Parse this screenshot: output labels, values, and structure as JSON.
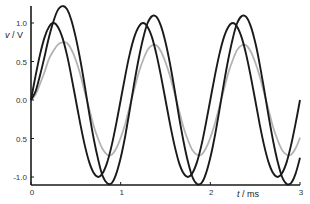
{
  "chart_data": {
    "type": "line",
    "title": "",
    "xlabel_var": "t",
    "xlabel_unit": " / ms",
    "ylabel_var": "v",
    "ylabel_unit": " / V",
    "xlim": [
      0,
      3
    ],
    "ylim": [
      -1.15,
      1.25
    ],
    "grid": false,
    "legend": "none",
    "x_ticks": [
      {
        "value": 0,
        "label": "0"
      },
      {
        "value": 1,
        "label": "1"
      },
      {
        "value": 2,
        "label": "2"
      },
      {
        "value": 3,
        "label": "3"
      }
    ],
    "y_ticks": [
      {
        "value": 1.0,
        "label": "1.0"
      },
      {
        "value": 0.5,
        "label": "0.5"
      },
      {
        "value": 0.0,
        "label": "0.0"
      },
      {
        "value": -0.5,
        "label": "0.5"
      },
      {
        "value": -1.0,
        "label": "-1.0"
      }
    ],
    "x": [
      0,
      0.05,
      0.1,
      0.15,
      0.2,
      0.25,
      0.3,
      0.35,
      0.4,
      0.45,
      0.5,
      0.55,
      0.6,
      0.65,
      0.7,
      0.75,
      0.8,
      0.85,
      0.9,
      0.95,
      1,
      1.05,
      1.1,
      1.15,
      1.2,
      1.25,
      1.3,
      1.35,
      1.4,
      1.45,
      1.5,
      1.55,
      1.6,
      1.65,
      1.7,
      1.75,
      1.8,
      1.85,
      1.9,
      1.95,
      2,
      2.05,
      2.1,
      2.15,
      2.2,
      2.25,
      2.3,
      2.35,
      2.4,
      2.45,
      2.5,
      2.55,
      2.6,
      2.65,
      2.7,
      2.75,
      2.8,
      2.85,
      2.9,
      2.95,
      3
    ],
    "series": [
      {
        "name": "source voltage",
        "color": "#1a1a1a",
        "values": [
          0,
          0.31,
          0.59,
          0.81,
          0.95,
          1,
          0.95,
          0.81,
          0.59,
          0.31,
          0,
          -0.31,
          -0.59,
          -0.81,
          -0.95,
          -1,
          -0.95,
          -0.81,
          -0.59,
          -0.31,
          0,
          0.31,
          0.59,
          0.81,
          0.95,
          1,
          0.95,
          0.81,
          0.59,
          0.31,
          0,
          -0.31,
          -0.59,
          -0.81,
          -0.95,
          -1,
          -0.95,
          -0.81,
          -0.59,
          -0.31,
          0,
          0.31,
          0.59,
          0.81,
          0.95,
          1,
          0.95,
          0.81,
          0.59,
          0.31,
          0,
          -0.31,
          -0.59,
          -0.81,
          -0.95,
          -1,
          -0.95,
          -0.81,
          -0.59,
          -0.31,
          0
        ]
      },
      {
        "name": "lagging voltage (large)",
        "color": "#1a1a1a",
        "values": [
          0,
          0.11,
          0.32,
          0.56,
          0.81,
          1.02,
          1.17,
          1.22,
          1.18,
          1.04,
          0.81,
          0.52,
          0.18,
          -0.18,
          -0.51,
          -0.78,
          -0.99,
          -1.08,
          -1.08,
          -0.96,
          -0.75,
          -0.47,
          -0.14,
          0.21,
          0.53,
          0.8,
          1.0,
          1.09,
          1.08,
          0.96,
          0.75,
          0.47,
          0.14,
          -0.21,
          -0.53,
          -0.8,
          -1.0,
          -1.09,
          -1.08,
          -0.96,
          -0.75,
          -0.47,
          -0.14,
          0.21,
          0.53,
          0.8,
          1.0,
          1.09,
          1.08,
          0.96,
          0.75,
          0.47,
          0.14,
          -0.21,
          -0.53,
          -0.8,
          -1.0,
          -1.09,
          -1.08,
          -0.96,
          -0.75
        ]
      },
      {
        "name": "lagging voltage (small)",
        "color": "#b3b3b3",
        "values": [
          0,
          0.07,
          0.21,
          0.36,
          0.53,
          0.64,
          0.72,
          0.75,
          0.74,
          0.66,
          0.52,
          0.33,
          0.1,
          -0.12,
          -0.34,
          -0.51,
          -0.64,
          -0.71,
          -0.71,
          -0.63,
          -0.49,
          -0.31,
          -0.09,
          0.13,
          0.35,
          0.52,
          0.65,
          0.71,
          0.71,
          0.63,
          0.49,
          0.31,
          0.09,
          -0.13,
          -0.35,
          -0.52,
          -0.65,
          -0.71,
          -0.71,
          -0.63,
          -0.49,
          -0.31,
          -0.09,
          0.13,
          0.35,
          0.52,
          0.65,
          0.71,
          0.71,
          0.63,
          0.49,
          0.31,
          0.09,
          -0.13,
          -0.35,
          -0.52,
          -0.65,
          -0.71,
          -0.71,
          -0.63,
          -0.49
        ]
      }
    ]
  },
  "layout": {
    "plot_left": 31,
    "plot_right": 300,
    "y_zero_px": 100,
    "px_per_volt": 77,
    "x_axis_px": 185,
    "y_axis_top_px": 6
  }
}
